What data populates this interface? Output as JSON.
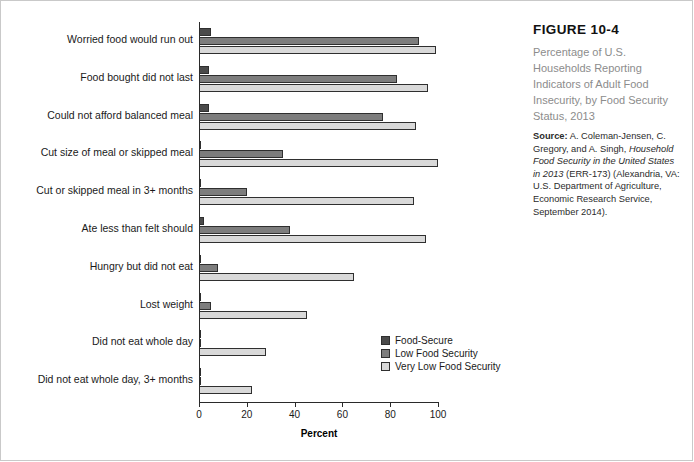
{
  "figure": {
    "number": "FIGURE 10-4",
    "title": "Percentage of U.S. Households Reporting Indicators of Adult Food Insecurity, by Food Security Status, 2013",
    "source_label": "Source:",
    "source_text_1": " A. Coleman-Jensen, C. Gregory, and A. Singh, ",
    "source_italic": "Household Food Security in the United States in 2013",
    "source_text_2": " (ERR-173) (Alexandria, VA: U.S. Department of Agriculture, Economic Research Service, September 2014)."
  },
  "colors": {
    "food_secure": "#4a4a4a",
    "low_food_security": "#7d7d7d",
    "very_low_food_security": "#d9d9d9",
    "axis": "#2a2a2a"
  },
  "legend": {
    "position": "inside-lower-right",
    "entries": [
      {
        "label": "Food-Secure",
        "color": "#4a4a4a"
      },
      {
        "label": "Low Food Security",
        "color": "#7d7d7d"
      },
      {
        "label": "Very Low Food Security",
        "color": "#d9d9d9"
      }
    ]
  },
  "chart_data": {
    "type": "bar",
    "orientation": "horizontal",
    "title": "Percentage of U.S. Households Reporting Indicators of Adult Food Insecurity, by Food Security Status, 2013",
    "xlabel": "Percent",
    "ylabel": "",
    "xlim": [
      0,
      100
    ],
    "xticks": [
      0,
      20,
      40,
      60,
      80,
      100
    ],
    "xticklabels": [
      "0",
      "20",
      "40",
      "60",
      "80",
      "100"
    ],
    "grid": false,
    "categories": [
      "Worried food would run out",
      "Food bought did not last",
      "Could not afford balanced meal",
      "Cut size of meal or skipped meal",
      "Cut or skipped meal in 3+ months",
      "Ate less than felt should",
      "Hungry but did not eat",
      "Lost weight",
      "Did not eat whole day",
      "Did not eat whole day, 3+ months"
    ],
    "series": [
      {
        "name": "Food-Secure",
        "color": "#4a4a4a",
        "values": [
          5,
          4,
          4,
          1,
          0,
          2,
          0,
          0,
          1,
          0
        ]
      },
      {
        "name": "Low Food Security",
        "color": "#7d7d7d",
        "values": [
          92,
          83,
          77,
          35,
          20,
          38,
          8,
          5,
          1,
          1
        ]
      },
      {
        "name": "Very Low Food Security",
        "color": "#d9d9d9",
        "values": [
          99,
          96,
          91,
          100,
          90,
          95,
          65,
          45,
          28,
          22
        ]
      }
    ]
  }
}
